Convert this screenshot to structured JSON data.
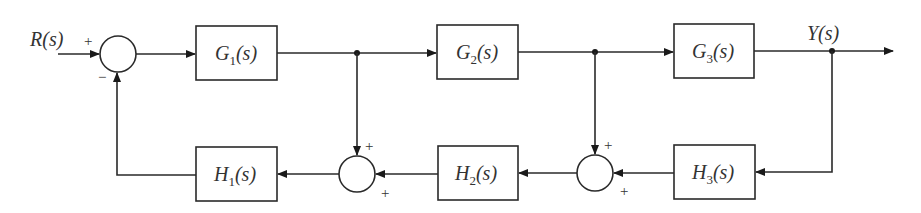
{
  "diagram": {
    "type": "block-diagram",
    "signals": {
      "input": "R(s)",
      "output": "Y(s)"
    },
    "blocks": {
      "G1": {
        "name": "G",
        "sub": "1",
        "arg": "(s)"
      },
      "G2": {
        "name": "G",
        "sub": "2",
        "arg": "(s)"
      },
      "G3": {
        "name": "G",
        "sub": "3",
        "arg": "(s)"
      },
      "H1": {
        "name": "H",
        "sub": "1",
        "arg": "(s)"
      },
      "H2": {
        "name": "H",
        "sub": "2",
        "arg": "(s)"
      },
      "H3": {
        "name": "H",
        "sub": "3",
        "arg": "(s)"
      }
    },
    "summing_junctions": {
      "S1": {
        "input_sign": "+",
        "feedback_sign": "−"
      },
      "S2": {
        "top_sign": "+",
        "right_sign": "+"
      },
      "S3": {
        "top_sign": "+",
        "right_sign": "+"
      }
    },
    "connections": [
      "R(s) -> S1 (+)",
      "S1 -> G1",
      "G1 -> branch A -> G2",
      "G2 -> branch B -> G3",
      "G3 -> branch C -> Y(s)",
      "branch C -> H3 -> S3 (+)",
      "branch B -> S3 (+)",
      "S3 -> H2 -> S2 (+)",
      "branch A -> S2 (+)",
      "S2 -> H1 -> S1 (−)"
    ],
    "colors": {
      "stroke": "#2a2a2a",
      "text": "#333333",
      "background": "#ffffff"
    }
  }
}
